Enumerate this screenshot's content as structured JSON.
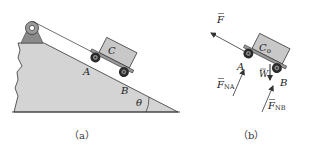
{
  "figure": {
    "panel_a": {
      "caption": "（a）",
      "labels": {
        "cart": "C",
        "wheel_front": "A",
        "wheel_rear": "B",
        "angle": "θ"
      }
    },
    "panel_b": {
      "caption": "（b）",
      "labels": {
        "force_pull": "F",
        "center_of_mass": "C",
        "center_of_mass_sub": "o",
        "wheel_front": "A",
        "wheel_rear": "B",
        "weight": "W",
        "normal_a": "F",
        "normal_a_sub": "NA",
        "normal_b": "F",
        "normal_b_sub": "NB"
      }
    },
    "colors": {
      "ground_fill": "#d4d4d4",
      "cart_fill": "#c8c8c8",
      "pulley_support": "#8a8a8a",
      "line": "#333333",
      "wheel": "#2a2a2a"
    }
  }
}
